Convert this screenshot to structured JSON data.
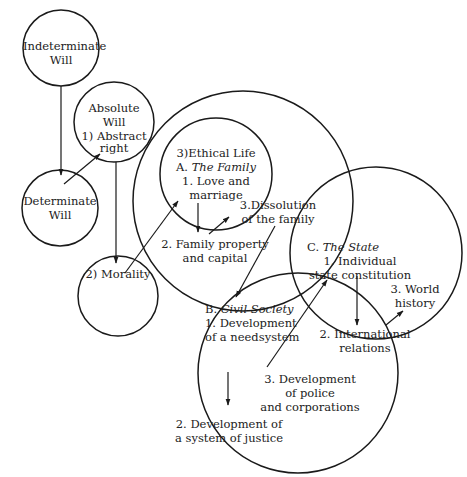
{
  "diagram": {
    "type": "hegel-philosophy-of-right-circles",
    "colors": {
      "stroke": "#1a1a1a",
      "text": "#222222",
      "background": "#ffffff"
    },
    "nodes": {
      "indeterminate_will": {
        "line1": "Indeterminate",
        "line2": "Will"
      },
      "absolute_will": {
        "line1": "Absolute",
        "line2": "Will",
        "line3": "1) Abstract",
        "line4": "right"
      },
      "determinate_will": {
        "line1": "Determinate",
        "line2": "Will"
      },
      "morality": {
        "line1": "2) Morality"
      },
      "ethical_life": {
        "title": "3)Ethical Life"
      },
      "family": {
        "prefix": "A. ",
        "title": "The Family",
        "item1_line1": "1. Love and",
        "item1_line2": "marriage",
        "item2_line1": "2. Family property",
        "item2_line2": "and capital",
        "item3_line1": "3.Dissolution",
        "item3_line2": "of the family"
      },
      "civil_society": {
        "prefix": "B. ",
        "title": "Civil Society",
        "item1_line1": "1. Development",
        "item1_line2": "of a needsystem",
        "item2_line1": "2. Development of",
        "item2_line2": "a system of justice",
        "item3_line1": "3. Development",
        "item3_line2": "of police",
        "item3_line3": "and corporations"
      },
      "state": {
        "prefix": "C. ",
        "title": "The State",
        "item1_line1": "1. Individual",
        "item1_line2": "state constitution",
        "item2_line1": "2. International",
        "item2_line2": "relations",
        "item3_line1": "3. World",
        "item3_line2": "history"
      }
    },
    "edges": [
      {
        "from": "Indeterminate Will",
        "to": "Determinate Will"
      },
      {
        "from": "Determinate Will",
        "to": "Absolute Will (Abstract right)"
      },
      {
        "from": "Absolute Will",
        "to": "Morality"
      },
      {
        "from": "Morality",
        "to": "Ethical Life (Family)"
      },
      {
        "from": "Love and marriage",
        "to": "Family property and capital"
      },
      {
        "from": "Family property and capital",
        "to": "Dissolution of the family"
      },
      {
        "from": "Dissolution of the family",
        "to": "Civil Society"
      },
      {
        "from": "Development of a needsystem",
        "to": "Development of a system of justice"
      },
      {
        "from": "Development of police and corporations",
        "to": "Individual state constitution"
      },
      {
        "from": "Individual state constitution",
        "to": "International relations"
      },
      {
        "from": "International relations",
        "to": "World history"
      }
    ]
  }
}
